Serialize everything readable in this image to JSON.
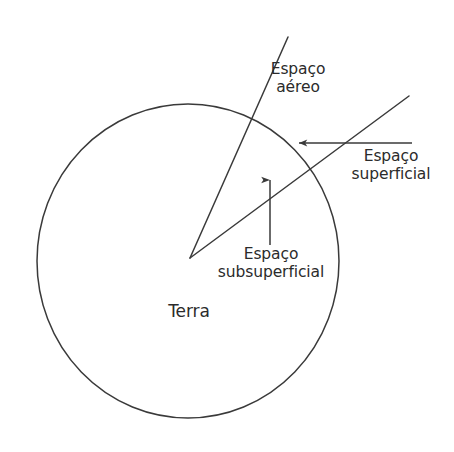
{
  "figure": {
    "type": "diagram",
    "title_visible": false,
    "background_color": "#ffffff",
    "stroke_color": "#3a3a3a",
    "text_color": "#2b2b2b"
  },
  "shapes": {
    "earth_circle": {
      "name": "Terra",
      "center_x": 188,
      "center_y": 261,
      "radius_x": 151,
      "radius_y": 157
    },
    "air_boundary_line": {
      "from_x": 190,
      "from_y": 258,
      "to_x": 288,
      "to_y": 37
    },
    "surface_boundary_line": {
      "from_x": 190,
      "from_y": 258,
      "to_x": 409,
      "to_y": 96
    },
    "surface_arrow": {
      "from_x": 412,
      "from_y": 143,
      "to_x": 297,
      "to_y": 143,
      "direction": "left"
    },
    "subsurface_arrow": {
      "from_x": 270,
      "from_y": 245,
      "to_x": 270,
      "to_y": 177,
      "direction": "up"
    }
  },
  "labels": {
    "espaco_aereo": {
      "line1": "Espaço",
      "line2": "aéreo"
    },
    "espaco_superficial": {
      "line1": "Espaço",
      "line2": "superficial"
    },
    "espaco_subsuperficial": {
      "line1": "Espaço",
      "line2": "subsuperficial"
    },
    "terra": {
      "line1": "Terra"
    }
  }
}
